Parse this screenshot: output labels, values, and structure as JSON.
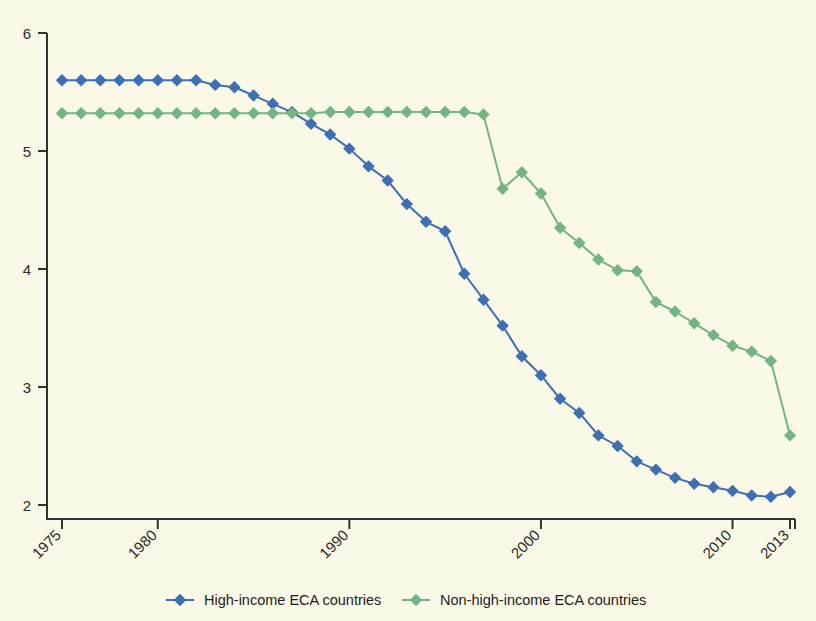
{
  "chart_data": {
    "type": "line",
    "title": "",
    "subtitle": "",
    "xlabel": "",
    "ylabel": "",
    "xlim": [
      1975,
      2013
    ],
    "ylim": [
      2,
      6
    ],
    "grid": false,
    "legend_position": "bottom",
    "x_tick_labels": [
      "1975",
      "1980",
      "1990",
      "2000",
      "2010",
      "2013"
    ],
    "x_tick_values": [
      1975,
      1980,
      1990,
      2000,
      2010,
      2013
    ],
    "y_tick_labels": [
      "2",
      "3",
      "4",
      "5",
      "6"
    ],
    "y_tick_values": [
      2,
      3,
      4,
      5,
      6
    ],
    "x": [
      1975,
      1976,
      1977,
      1978,
      1979,
      1980,
      1981,
      1982,
      1983,
      1984,
      1985,
      1986,
      1987,
      1988,
      1989,
      1990,
      1991,
      1992,
      1993,
      1994,
      1995,
      1996,
      1997,
      1998,
      1999,
      2000,
      2001,
      2002,
      2003,
      2004,
      2005,
      2006,
      2007,
      2008,
      2009,
      2010,
      2011,
      2012,
      2013
    ],
    "series": [
      {
        "name": "High-income ECA countries",
        "color": "#3d6fb5",
        "marker": "diamond",
        "values": [
          5.6,
          5.6,
          5.6,
          5.6,
          5.6,
          5.6,
          5.6,
          5.6,
          5.56,
          5.54,
          5.47,
          5.4,
          5.33,
          5.23,
          5.14,
          5.02,
          4.87,
          4.75,
          4.55,
          4.4,
          4.32,
          3.96,
          3.74,
          3.52,
          3.26,
          3.1,
          2.9,
          2.78,
          2.59,
          2.5,
          2.37,
          2.3,
          2.23,
          2.18,
          2.15,
          2.12,
          2.08,
          2.07,
          2.11
        ]
      },
      {
        "name": "Non-high-income ECA countries",
        "color": "#72b583",
        "marker": "diamond",
        "values": [
          5.32,
          5.32,
          5.32,
          5.32,
          5.32,
          5.32,
          5.32,
          5.32,
          5.32,
          5.32,
          5.32,
          5.32,
          5.32,
          5.32,
          5.33,
          5.33,
          5.33,
          5.33,
          5.33,
          5.33,
          5.33,
          5.33,
          5.31,
          4.68,
          4.82,
          4.64,
          4.35,
          4.22,
          4.08,
          3.99,
          3.98,
          3.72,
          3.64,
          3.54,
          3.44,
          3.35,
          3.3,
          3.22,
          2.59
        ]
      }
    ]
  },
  "legend": {
    "entries": [
      {
        "label": "High-income ECA countries",
        "color": "#3d6fb5"
      },
      {
        "label": "Non-high-income ECA countries",
        "color": "#72b583"
      }
    ]
  },
  "style": {
    "background": "#faf8e6",
    "axis_color": "#33312c"
  }
}
